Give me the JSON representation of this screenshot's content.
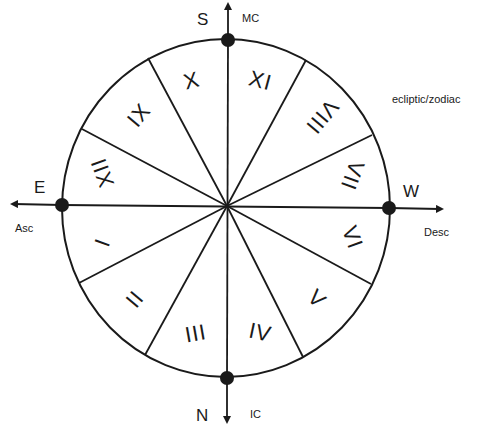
{
  "diagram": {
    "type": "astrological house wheel",
    "ecliptic_label": "ecliptic/zodiac",
    "cardinal_points": {
      "top": {
        "direction": "S",
        "angle_label": "MC"
      },
      "bottom": {
        "direction": "N",
        "angle_label": "IC"
      },
      "left": {
        "direction": "E",
        "angle_label": "Asc"
      },
      "right": {
        "direction": "W",
        "angle_label": "Desc"
      }
    },
    "houses": [
      {
        "number": 1,
        "label": "I"
      },
      {
        "number": 2,
        "label": "II"
      },
      {
        "number": 3,
        "label": "III"
      },
      {
        "number": 4,
        "label": "IV"
      },
      {
        "number": 5,
        "label": "V"
      },
      {
        "number": 6,
        "label": "VI"
      },
      {
        "number": 7,
        "label": "VII"
      },
      {
        "number": 8,
        "label": "VIII"
      },
      {
        "number": 9,
        "label": "IX"
      },
      {
        "number": 10,
        "label": "X"
      },
      {
        "number": 11,
        "label": "XI"
      },
      {
        "number": 12,
        "label": "XII"
      }
    ],
    "colors": {
      "line": "#1a1a1a",
      "background": "#ffffff"
    }
  }
}
